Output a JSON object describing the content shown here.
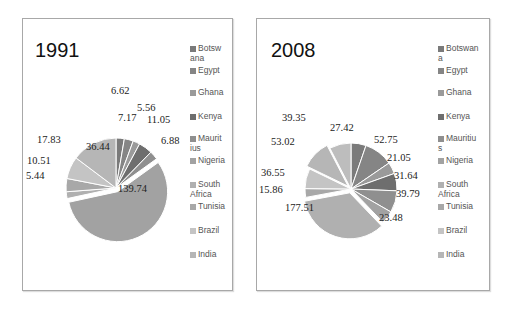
{
  "chart_data": [
    {
      "type": "pie",
      "title": "1991",
      "legend": [
        "Botswana",
        "Egypt",
        "Ghana",
        "Kenya",
        "Mauritius",
        "Nigeria",
        "South Africa",
        "Tunisia",
        "Brazil",
        "India"
      ],
      "legend_display": [
        "Botsw\nana",
        "Egypt",
        "Ghana",
        "Kenya",
        "Maurit\nius",
        "Nigeria",
        "South\nAfrica",
        "Tunisia",
        "Brazil",
        "India"
      ],
      "slice_labels_clockwise": [
        "6.62",
        "7.17",
        "5.56",
        "11.05",
        "6.88",
        "139.74",
        "5.44",
        "10.51",
        "17.83",
        "36.44"
      ],
      "values_clockwise": [
        6.62,
        7.17,
        5.56,
        11.05,
        6.88,
        139.74,
        5.44,
        10.51,
        17.83,
        36.44
      ],
      "legend_position": "right"
    },
    {
      "type": "pie",
      "title": "2008",
      "legend": [
        "Botswana",
        "Egypt",
        "Ghana",
        "Kenya",
        "Mauritius",
        "Nigeria",
        "South Africa",
        "Tunisia",
        "Brazil",
        "India"
      ],
      "legend_display": [
        "Botswan\na",
        "Egypt",
        "Ghana",
        "Kenya",
        "Mauritiu\ns",
        "Nigeria",
        "South\nAfrica",
        "Tunisia",
        "Brazil",
        "India"
      ],
      "slice_labels_clockwise": [
        "27.42",
        "52.75",
        "21.05",
        "31.64",
        "39.79",
        "23.48",
        "177.51",
        "15.86",
        "36.55",
        "53.02",
        "39.35"
      ],
      "values_clockwise": [
        27.42,
        52.75,
        21.05,
        31.64,
        39.79,
        23.48,
        177.51,
        15.86,
        36.55,
        53.02,
        39.35
      ],
      "legend_position": "right"
    }
  ],
  "charts": [
    {
      "title": "1991"
    },
    {
      "title": "2008"
    }
  ],
  "colors": [
    "#7a7a7a",
    "#858585",
    "#9a9a9a",
    "#6e6e6e",
    "#8f8f8f",
    "#a2a2a2",
    "#b0b0b0",
    "#a8a8a8",
    "#c4c4c4",
    "#b6b6b6",
    "#bdbdbd"
  ]
}
